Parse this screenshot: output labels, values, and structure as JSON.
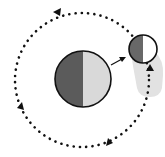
{
  "diagram": {
    "type": "orbit-illustration",
    "orbit": {
      "center": [
        82,
        80
      ],
      "radius": 67,
      "style": "dotted",
      "direction": "counterclockwise",
      "arrowheads": 4
    },
    "large_body": {
      "center": [
        83,
        79
      ],
      "radius": 28,
      "dark_half": "left",
      "colors": {
        "dark": "#5b5b5b",
        "light": "#d9d9d9",
        "outline": "#111111"
      }
    },
    "small_body": {
      "center": [
        143,
        49
      ],
      "radius": 14,
      "dark_half": "left",
      "colors": {
        "dark": "#686868",
        "light": "#ffffff",
        "outline": "#111111"
      }
    },
    "shadow": {
      "color": "#e2e2e2",
      "extends_from": "small_body",
      "direction": "down"
    },
    "pointer_arrow": {
      "from": "large_body",
      "to": "small_body"
    },
    "colors": {
      "background": "#ffffff",
      "dots": "#111111"
    }
  }
}
